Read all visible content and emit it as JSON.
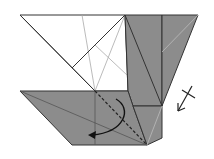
{
  "diagram": {
    "type": "origami-fold-step",
    "colors": {
      "paper_front": "#ffffff",
      "paper_back": "#8c8c8c",
      "line": "#333333",
      "crease": "#b0b0b0",
      "arrow": "#111111"
    },
    "symbols": {
      "valley_fold_line": "dashed-line",
      "fold_arrow": "curved-arrow-left",
      "turn_over_arrow": "arrow-with-cross"
    }
  }
}
